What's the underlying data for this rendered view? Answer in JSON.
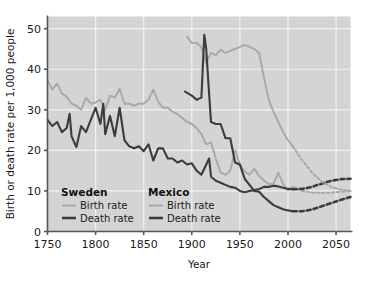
{
  "axes": {
    "ylabel": "Birth or death rate per 1,000 people",
    "xlabel": "Year",
    "yticks": [
      "0",
      "10",
      "20",
      "30",
      "40",
      "50"
    ],
    "xticks": [
      "1750",
      "1800",
      "1850",
      "1900",
      "1950",
      "2000",
      "2050"
    ]
  },
  "legend": {
    "sweden": {
      "heading": "Sweden",
      "birth_label": "Birth rate",
      "death_label": "Death rate"
    },
    "mexico": {
      "heading": "Mexico",
      "birth_label": "Birth rate",
      "death_label": "Death rate"
    }
  },
  "colors": {
    "plot_background": "#d4d4d4",
    "gridline": "#f2f2f2",
    "axis": "#55565a",
    "birth_rate_line": "#a8a8a8",
    "death_rate_line": "#3c3c3c",
    "page_background": "#ffffff"
  },
  "chart_data": {
    "type": "line",
    "title": "",
    "xlabel": "Year",
    "ylabel": "Birth or death rate per 1,000 people",
    "xlim": [
      1750,
      2065
    ],
    "ylim": [
      0,
      53
    ],
    "xticks": [
      1750,
      1800,
      1850,
      1900,
      1950,
      2000,
      2050
    ],
    "yticks": [
      0,
      10,
      20,
      30,
      40,
      50
    ],
    "grid": true,
    "legend_position": "inside-bottom-left",
    "series": [
      {
        "name": "Sweden Birth rate",
        "country": "Sweden",
        "measure": "birth",
        "style": "solid",
        "color": "#a8a8a8",
        "x": [
          1750,
          1755,
          1760,
          1765,
          1770,
          1775,
          1780,
          1785,
          1790,
          1795,
          1800,
          1805,
          1810,
          1815,
          1820,
          1825,
          1830,
          1835,
          1840,
          1845,
          1850,
          1855,
          1860,
          1865,
          1870,
          1875,
          1880,
          1885,
          1890,
          1895,
          1900,
          1905,
          1910,
          1915,
          1920,
          1925,
          1930,
          1935,
          1940,
          1945,
          1950,
          1955,
          1960,
          1965,
          1970,
          1975,
          1980,
          1985,
          1990,
          1995,
          2000,
          2005
        ],
        "y": [
          37.2,
          35.0,
          36.5,
          34.0,
          33.2,
          31.5,
          31.0,
          30.0,
          33.0,
          31.5,
          31.8,
          32.5,
          30.0,
          33.5,
          33.0,
          35.2,
          31.5,
          31.5,
          31.0,
          31.5,
          31.5,
          32.5,
          35.0,
          32.0,
          30.5,
          30.5,
          29.5,
          29.0,
          28.0,
          27.0,
          26.5,
          25.5,
          24.0,
          21.5,
          22.0,
          18.0,
          14.5,
          14.0,
          15.0,
          20.0,
          16.5,
          14.8,
          14.0,
          15.5,
          13.7,
          12.6,
          11.7,
          11.8,
          14.5,
          11.7,
          10.2,
          11.0
        ]
      },
      {
        "name": "Sweden Death rate",
        "country": "Sweden",
        "measure": "death",
        "style": "solid",
        "color": "#3c3c3c",
        "x": [
          1750,
          1755,
          1760,
          1765,
          1770,
          1773,
          1775,
          1780,
          1785,
          1790,
          1795,
          1800,
          1805,
          1808,
          1810,
          1815,
          1820,
          1825,
          1830,
          1835,
          1840,
          1845,
          1850,
          1855,
          1860,
          1865,
          1870,
          1875,
          1880,
          1885,
          1890,
          1895,
          1900,
          1905,
          1910,
          1918,
          1920,
          1925,
          1930,
          1935,
          1940,
          1945,
          1950,
          1955,
          1960,
          1965,
          1970,
          1975,
          1980,
          1985,
          1990,
          1995,
          2000,
          2005
        ],
        "y": [
          27.5,
          26.0,
          27.0,
          24.5,
          25.5,
          29.0,
          23.5,
          20.8,
          26.0,
          24.5,
          27.5,
          30.5,
          26.5,
          31.5,
          24.0,
          28.5,
          23.5,
          30.5,
          22.5,
          21.0,
          20.5,
          21.0,
          19.8,
          21.5,
          17.5,
          20.5,
          20.5,
          18.0,
          18.0,
          17.0,
          17.5,
          16.5,
          16.8,
          15.0,
          14.0,
          18.0,
          13.5,
          12.5,
          12.0,
          11.5,
          11.0,
          10.8,
          10.0,
          9.7,
          10.0,
          10.2,
          10.5,
          11.0,
          11.0,
          11.3,
          11.1,
          10.8,
          10.5,
          10.4
        ]
      },
      {
        "name": "Mexico Birth rate",
        "country": "Mexico",
        "measure": "birth",
        "style": "solid",
        "color": "#a8a8a8",
        "x": [
          1895,
          1900,
          1905,
          1910,
          1915,
          1920,
          1925,
          1930,
          1935,
          1940,
          1945,
          1950,
          1955,
          1960,
          1965,
          1970,
          1975,
          1980,
          1985,
          1990,
          1995,
          2000,
          2005
        ],
        "y": [
          48.0,
          46.5,
          46.5,
          45.5,
          41.5,
          44.0,
          43.5,
          44.8,
          44.0,
          44.5,
          45.0,
          45.5,
          46.0,
          45.5,
          45.0,
          44.0,
          38.0,
          32.5,
          29.5,
          27.0,
          24.5,
          22.5,
          21.0
        ]
      },
      {
        "name": "Mexico Death rate",
        "country": "Mexico",
        "measure": "death",
        "style": "solid",
        "color": "#3c3c3c",
        "x": [
          1893,
          1900,
          1905,
          1910,
          1913,
          1915,
          1918,
          1920,
          1925,
          1930,
          1935,
          1940,
          1945,
          1950,
          1955,
          1960,
          1965,
          1970,
          1975,
          1980,
          1985,
          1990,
          1995,
          2000,
          2005
        ],
        "y": [
          34.5,
          33.5,
          32.5,
          33.0,
          48.5,
          45.0,
          34.0,
          27.0,
          26.5,
          26.5,
          23.0,
          23.0,
          17.0,
          16.5,
          13.0,
          11.5,
          10.0,
          9.8,
          8.5,
          7.5,
          6.5,
          6.0,
          5.5,
          5.2,
          5.0
        ]
      },
      {
        "name": "Sweden Birth rate (projected)",
        "country": "Sweden",
        "measure": "birth",
        "style": "dashed",
        "color": "#a8a8a8",
        "x": [
          2005,
          2015,
          2025,
          2035,
          2045,
          2055,
          2065
        ],
        "y": [
          11.0,
          10.0,
          9.6,
          9.5,
          9.6,
          9.8,
          10.0
        ]
      },
      {
        "name": "Sweden Death rate (projected)",
        "country": "Sweden",
        "measure": "death",
        "style": "dashed",
        "color": "#3c3c3c",
        "x": [
          2005,
          2015,
          2025,
          2035,
          2045,
          2055,
          2065
        ],
        "y": [
          10.4,
          10.5,
          11.0,
          11.8,
          12.5,
          12.9,
          13.0
        ]
      },
      {
        "name": "Mexico Birth rate (projected)",
        "country": "Mexico",
        "measure": "birth",
        "style": "dashed",
        "color": "#a8a8a8",
        "x": [
          2005,
          2015,
          2025,
          2035,
          2045,
          2055,
          2065
        ],
        "y": [
          21.0,
          17.5,
          14.5,
          12.3,
          11.0,
          10.3,
          10.0
        ]
      },
      {
        "name": "Mexico Death rate (projected)",
        "country": "Mexico",
        "measure": "death",
        "style": "dashed",
        "color": "#3c3c3c",
        "x": [
          2005,
          2015,
          2025,
          2035,
          2045,
          2055,
          2065
        ],
        "y": [
          5.0,
          5.0,
          5.4,
          6.2,
          7.0,
          7.8,
          8.5
        ]
      }
    ]
  }
}
